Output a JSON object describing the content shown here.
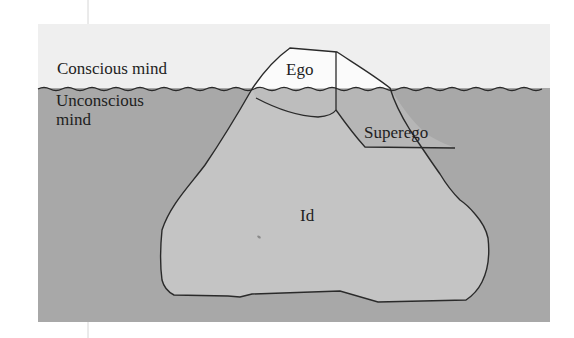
{
  "figure": {
    "colors": {
      "background": "#ffffff",
      "sky": "#f0f0f0",
      "water": "#a9a9a9",
      "iceberg_above": "#fbfbfb",
      "iceberg_below": "#c4c4c4",
      "outline": "#2a2a2a",
      "guide_line": "#d4d4d4"
    },
    "levels": {
      "conscious": "Conscious mind",
      "unconscious": "Unconscious mind"
    },
    "regions": {
      "ego": "Ego",
      "superego": "Superego",
      "id": "Id"
    }
  }
}
